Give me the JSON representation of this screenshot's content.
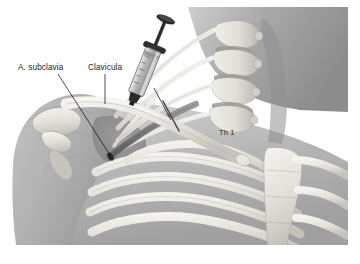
{
  "figure": {
    "kind": "medical-anatomical-illustration",
    "style": "grayscale pencil-and-wash medical atlas drawing",
    "canvas": {
      "width": 360,
      "height": 264
    },
    "plate_bounds": {
      "x": 11,
      "y": 7,
      "width": 337,
      "height": 238
    },
    "background_color": "#ffffff"
  },
  "labels": [
    {
      "id": "a-subclavia",
      "text": "A. subclavia",
      "text_x": 18,
      "text_y": 70,
      "leader_from": {
        "x": 58,
        "y": 74
      },
      "leader_to": {
        "x": 110,
        "y": 155
      },
      "target": "subclavian artery cut stump"
    },
    {
      "id": "clavicula",
      "text": "Clavicula",
      "text_x": 88,
      "text_y": 70,
      "leader_from": {
        "x": 105,
        "y": 74
      },
      "leader_to": {
        "x": 105,
        "y": 104
      },
      "target": "clavicle"
    },
    {
      "id": "th-1",
      "text": "Th 1",
      "text_x": 219,
      "text_y": 135,
      "leader_from": null,
      "leader_to": null,
      "target": "first thoracic vertebra"
    }
  ],
  "needle_leader": {
    "id": "needle-tip-leader",
    "from": {
      "x": 154,
      "y": 88
    },
    "to": {
      "x": 171,
      "y": 120
    },
    "target": "needle tip beneath the clavicle"
  },
  "colors": {
    "paper": "#ffffff",
    "skin_light": "#d9d9d9",
    "skin_mid": "#b8b8b8",
    "skin_dark": "#9a9a9a",
    "muscle_shadow": "#8e8e8e",
    "bone_light": "#f1f1ec",
    "bone_mid": "#dedcd4",
    "bone_shadow": "#bdbbb2",
    "nerve": "#f4f4ef",
    "vessel_dark": "#6f6f6f",
    "syringe_metal": "#2e2e2e",
    "syringe_glass": "#c9c9c9",
    "needle": "#3a3a3a",
    "outline": "#6b6b6b",
    "label_ink": "#1c1c1c"
  },
  "structures": [
    {
      "id": "neck",
      "name": "Neck / sternocleidomastoid region",
      "interactable": false
    },
    {
      "id": "shoulder-deltoid",
      "name": "Shoulder and deltoid mass",
      "interactable": false
    },
    {
      "id": "scapula-acromion",
      "name": "Acromion and coracoid process of scapula",
      "interactable": false
    },
    {
      "id": "clavicle",
      "name": "Clavicle (Clavicula)",
      "interactable": false
    },
    {
      "id": "brachial-plexus",
      "name": "Brachial plexus nerve trunks",
      "interactable": false
    },
    {
      "id": "subclavian-artery",
      "name": "Subclavian artery (A. subclavia) with cut stump",
      "interactable": false
    },
    {
      "id": "vertebral-column",
      "name": "Cervicothoracic vertebral bodies with discs",
      "interactable": false
    },
    {
      "id": "first-rib",
      "name": "First rib",
      "interactable": false
    },
    {
      "id": "rib-cage",
      "name": "Rib cage with costal cartilages",
      "interactable": false
    },
    {
      "id": "sternum",
      "name": "Sternum / manubrium",
      "interactable": false
    },
    {
      "id": "syringe",
      "name": "Syringe with plunger and barrel",
      "interactable": false
    },
    {
      "id": "needle",
      "name": "Injection needle entering infraclavicular space",
      "interactable": false
    }
  ]
}
